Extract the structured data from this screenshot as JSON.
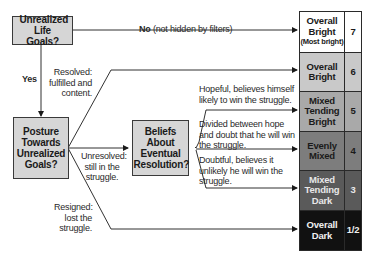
{
  "diagram": {
    "nodes": {
      "life_goals": {
        "label": "Unrealized Life Goals?"
      },
      "posture": {
        "label": "Posture Towards Unrealized Goals?"
      },
      "beliefs": {
        "label": "Beliefs About Eventual Resolution?"
      }
    },
    "edges": {
      "no": {
        "bold": "No",
        "rest": "(not hidden by filters)"
      },
      "yes": {
        "label": "Yes"
      },
      "resolved": {
        "label": "Resolved: fulfilled and content."
      },
      "unresolved": {
        "label": "Unresolved: still in the struggle."
      },
      "resigned": {
        "label": "Resigned: lost the struggle."
      },
      "hopeful": {
        "label": "Hopeful, believes himself likely to win the struggle."
      },
      "divided": {
        "label": "Divided between hope and doubt that he will win the struggle."
      },
      "doubtful": {
        "label": "Doubtful, believes it unlikely he will win the struggle."
      }
    },
    "scale": [
      {
        "name": "Overall Bright",
        "sub": "(Most bright)",
        "value": "7",
        "bg": "#ffffff",
        "fg": "#1a1a1a"
      },
      {
        "name": "Overall Bright",
        "sub": "",
        "value": "6",
        "bg": "#c9c9c9",
        "fg": "#1a1a1a"
      },
      {
        "name": "Mixed Tending Bright",
        "sub": "",
        "value": "5",
        "bg": "#a9a9a9",
        "fg": "#1a1a1a"
      },
      {
        "name": "Evenly Mixed",
        "sub": "",
        "value": "4",
        "bg": "#7d7d7d",
        "fg": "#1a1a1a"
      },
      {
        "name": "Mixed Tending Dark",
        "sub": "",
        "value": "3",
        "bg": "#5a5a5a",
        "fg": "#e8e8e8"
      },
      {
        "name": "Overall Dark",
        "sub": "",
        "value": "1/2",
        "bg": "#111111",
        "fg": "#f0f0f0"
      }
    ]
  }
}
